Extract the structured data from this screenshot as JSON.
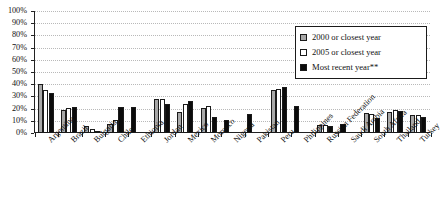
{
  "chart_data": {
    "type": "bar",
    "title": "",
    "xlabel": "",
    "ylabel": "",
    "ylim": [
      0,
      100
    ],
    "ytick_labels": [
      "100%",
      "90%",
      "80%",
      "70%",
      "60%",
      "50%",
      "40%",
      "30%",
      "20%",
      "10%",
      "0%"
    ],
    "ytick_values": [
      100,
      90,
      80,
      70,
      60,
      50,
      40,
      30,
      20,
      10,
      0
    ],
    "grid": true,
    "legend_position": "top-right",
    "categories": [
      "Argentina",
      "Brazil",
      "Bulgaria",
      "Chile",
      "Ethiopia",
      "Jordan",
      "Mexico",
      "Morocco",
      "Nigeria",
      "Pakistan",
      "Peru",
      "Philippines",
      "Russian Federation",
      "Saudi Arabia",
      "South Africa",
      "Thailand",
      "Turkey"
    ],
    "series": [
      {
        "name": "2000 or closest year",
        "color": "#a8a8a8",
        "values": [
          40,
          19,
          5.5,
          7.5,
          null,
          27.5,
          17,
          20.5,
          null,
          null,
          35.5,
          null,
          6.5,
          null,
          16.5,
          17,
          15
        ]
      },
      {
        "name": "2005 or closest year",
        "color": "#ffffff",
        "values": [
          35.5,
          20.5,
          3.5,
          10.5,
          null,
          27.5,
          23.5,
          22,
          null,
          null,
          36,
          null,
          6.5,
          null,
          15.5,
          18.5,
          14.5
        ]
      },
      {
        "name": "Most recent year**",
        "color": "#0b0b0b",
        "values": [
          33,
          21,
          2,
          21,
          21,
          24,
          26.5,
          13,
          11,
          15.5,
          37.5,
          22.5,
          5.5,
          7.5,
          12,
          18,
          13.5
        ]
      }
    ]
  },
  "legend": {
    "items": [
      {
        "label": "2000 or closest year",
        "swatch": "gray-swatch"
      },
      {
        "label": "2005 or closest year",
        "swatch": "white-swatch"
      },
      {
        "label": "Most recent year**",
        "swatch": "black-swatch"
      }
    ]
  }
}
